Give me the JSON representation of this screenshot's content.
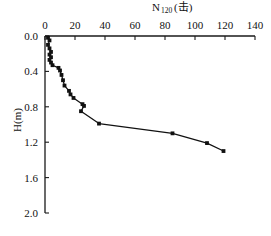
{
  "chart_data": {
    "type": "line",
    "title_main": "N",
    "title_sub": "120",
    "title_unit": "(击)",
    "xlabel": "N120(击)",
    "ylabel": "H(m)",
    "ylabel_main": "H",
    "ylabel_unit": "(m)",
    "xlim": [
      0,
      140
    ],
    "ylim": [
      0,
      2.0
    ],
    "y_inverted": true,
    "x_axis_position": "top",
    "grid": false,
    "legend": null,
    "xticks": [
      0,
      20,
      40,
      60,
      80,
      100,
      120,
      140
    ],
    "xtick_labels": [
      "0",
      "20",
      "40",
      "60",
      "80",
      "100",
      "120",
      "140"
    ],
    "yticks": [
      0.0,
      0.4,
      0.8,
      1.2,
      1.6,
      2.0
    ],
    "ytick_labels": [
      "0.0",
      "0.4",
      "0.8",
      "1.2",
      "1.6",
      "2.0"
    ],
    "marker": "square",
    "series": [
      {
        "name": "N120",
        "x": [
          2,
          3,
          2,
          3,
          4,
          3,
          4,
          3,
          4,
          5,
          9,
          10,
          11,
          12,
          13,
          16,
          17,
          19,
          25,
          26,
          24,
          36,
          85,
          108,
          119
        ],
        "y": [
          0.02,
          0.05,
          0.1,
          0.14,
          0.18,
          0.21,
          0.24,
          0.27,
          0.3,
          0.33,
          0.36,
          0.39,
          0.44,
          0.5,
          0.56,
          0.62,
          0.66,
          0.7,
          0.77,
          0.79,
          0.85,
          0.99,
          1.1,
          1.21,
          1.3
        ]
      }
    ]
  }
}
